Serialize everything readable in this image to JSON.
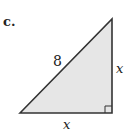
{
  "figure": {
    "part_label": "c.",
    "hypotenuse_label": "8",
    "vertical_leg_label": "x",
    "horizontal_leg_label": "x",
    "shape": "right-triangle",
    "right_angle_marker": true,
    "colors": {
      "fill": "#e6e6e6",
      "stroke": "#333333"
    }
  }
}
